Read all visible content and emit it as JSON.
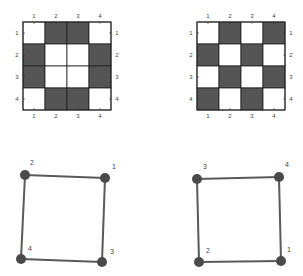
{
  "colors": {
    "dark_cell": "#555555",
    "light_cell": "#ffffff",
    "grid_line": "#222222",
    "edge": "#5a5a5a",
    "node": "#4a4a4a"
  },
  "grids": [
    {
      "id": "grid-left",
      "x": 23,
      "y": 22,
      "cell": 22,
      "row_labels": [
        "1",
        "2",
        "3",
        "4"
      ],
      "col_labels": [
        "1",
        "2",
        "3",
        "4"
      ],
      "cells": [
        [
          0,
          1,
          1,
          0
        ],
        [
          1,
          0,
          0,
          1
        ],
        [
          1,
          0,
          0,
          1
        ],
        [
          0,
          1,
          1,
          0
        ]
      ]
    },
    {
      "id": "grid-right",
      "x": 197,
      "y": 22,
      "cell": 22,
      "row_labels": [
        "1",
        "2",
        "3",
        "4"
      ],
      "col_labels": [
        "1",
        "2",
        "3",
        "4"
      ],
      "cells": [
        [
          0,
          1,
          0,
          1
        ],
        [
          1,
          0,
          1,
          0
        ],
        [
          0,
          1,
          0,
          1
        ],
        [
          1,
          0,
          1,
          0
        ]
      ]
    }
  ],
  "graphs": [
    {
      "id": "graph-left",
      "nodes": [
        {
          "label": "1",
          "x": 105,
          "y": 178,
          "lx": 114,
          "ly": 167
        },
        {
          "label": "2",
          "x": 25,
          "y": 175,
          "lx": 32,
          "ly": 163
        },
        {
          "label": "3",
          "x": 102,
          "y": 262,
          "lx": 112,
          "ly": 252
        },
        {
          "label": "4",
          "x": 21,
          "y": 259,
          "lx": 30,
          "ly": 249
        }
      ],
      "edges": [
        [
          "1",
          "2"
        ],
        [
          "2",
          "4"
        ],
        [
          "4",
          "3"
        ],
        [
          "3",
          "1"
        ]
      ]
    },
    {
      "id": "graph-right",
      "nodes": [
        {
          "label": "1",
          "x": 281,
          "y": 261,
          "lx": 289,
          "ly": 250
        },
        {
          "label": "2",
          "x": 199,
          "y": 262,
          "lx": 208,
          "ly": 251
        },
        {
          "label": "3",
          "x": 197,
          "y": 179,
          "lx": 205,
          "ly": 167
        },
        {
          "label": "4",
          "x": 279,
          "y": 177,
          "lx": 287,
          "ly": 165
        }
      ],
      "edges": [
        [
          "3",
          "4"
        ],
        [
          "4",
          "1"
        ],
        [
          "1",
          "2"
        ],
        [
          "2",
          "3"
        ]
      ]
    }
  ]
}
